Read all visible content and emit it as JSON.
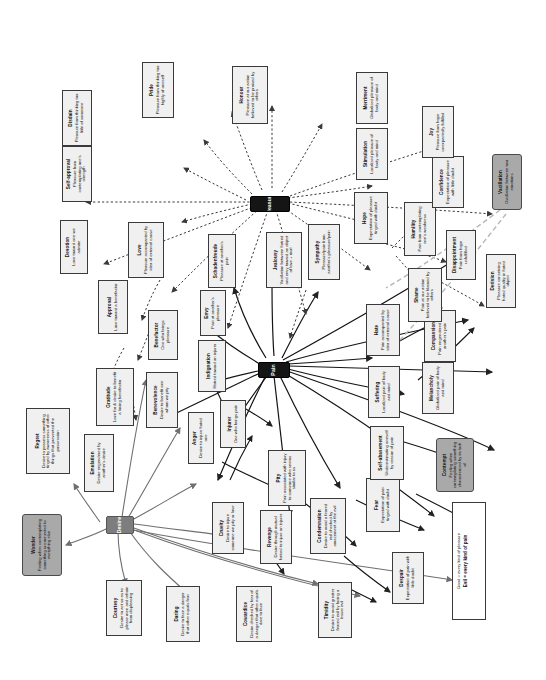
{
  "diagram": {
    "legend": {
      "line1": "Good = every kind of pleasure",
      "line2": "Evil = every kind of pain"
    },
    "core_nodes": [
      {
        "id": "desire",
        "label": "Desire"
      },
      {
        "id": "pain",
        "label": "Pain"
      },
      {
        "id": "pleasure",
        "label": "Pleasure"
      }
    ],
    "nodes": [
      {
        "id": "wonder",
        "title": "Wonder",
        "desc": "Feeling when contemplating something unconnected to everything else",
        "style": "shaded"
      },
      {
        "id": "regret",
        "title": "Regret",
        "desc": "Desire to possess something tinged by awareness of other things that prevented the possession",
        "style": "plain"
      },
      {
        "id": "emulation",
        "title": "Emulation",
        "desc": "Desire engendered by another's desire",
        "style": "plain"
      },
      {
        "id": "courtesy",
        "title": "Courtesy",
        "desc": "Desire to act so as to please men and refrain from displeasing",
        "style": "plain"
      },
      {
        "id": "daring",
        "title": "Daring",
        "desc": "Desire to face a danger that other equals fear",
        "style": "plain"
      },
      {
        "id": "gratitude",
        "title": "Gratitude",
        "desc": "Love for & desire to benefit a loving benefactor",
        "style": "plain"
      },
      {
        "id": "benevolence",
        "title": "Benevolence",
        "desc": "Desire to benefit one whom we pity",
        "style": "plain"
      },
      {
        "id": "benefactor",
        "title": "Benefactor",
        "desc": "One who brings pleasure",
        "style": "plain"
      },
      {
        "id": "approval",
        "title": "Approval",
        "desc": "Love toward a benefactor",
        "style": "plain"
      },
      {
        "id": "love",
        "title": "Love",
        "desc": "Pleasure accompanied by idea of external cause",
        "style": "plain"
      },
      {
        "id": "devotion",
        "title": "Devotion",
        "desc": "Love toward one we admire",
        "style": "plain"
      },
      {
        "id": "self_approval",
        "title": "Self-approval",
        "desc": "Pleasure from contemplating one's strength",
        "style": "plain"
      },
      {
        "id": "disdain",
        "title": "Disdain",
        "desc": "Pleasure from thinking too little of someone",
        "style": "plain"
      },
      {
        "id": "pride",
        "title": "Pride",
        "desc": "Pleasure from thinking too highly of oneself",
        "style": "plain"
      },
      {
        "id": "honour",
        "title": "Honour",
        "desc": "Pleasure at our action believed to be praised by others",
        "style": "plain"
      },
      {
        "id": "anger",
        "title": "Anger",
        "desc": "Desire to injure hated one",
        "style": "plain"
      },
      {
        "id": "injurer",
        "title": "Injurer",
        "desc": "One who brings pain",
        "style": "plain"
      },
      {
        "id": "indignation",
        "title": "Indignation",
        "desc": "Hatred toward an injurer",
        "style": "plain"
      },
      {
        "id": "envy",
        "title": "Envy",
        "desc": "Pain at another's pleasure",
        "style": "plain"
      },
      {
        "id": "schadenfreude",
        "title": "Schadenfreude",
        "desc": "Pleasure at another's pain",
        "style": "plain"
      },
      {
        "id": "jealousy",
        "title": "Jealousy",
        "desc": "Vacillation between hatred and envy toward an object of love + rival",
        "style": "plain"
      },
      {
        "id": "sympathy",
        "title": "Sympathy",
        "desc": "Pleasure/pain from another's pleasure/pain",
        "style": "plain"
      },
      {
        "id": "cruelty",
        "title": "Cruelty",
        "desc": "Desire to injure someone we pity or love",
        "style": "plain"
      },
      {
        "id": "pity",
        "title": "Pity",
        "desc": "Pain associated with injury to someone who seems similar to us",
        "style": "plain"
      },
      {
        "id": "revenge",
        "title": "Revenge",
        "desc": "Desire through mutual hatred to injure an injurer",
        "style": "plain"
      },
      {
        "id": "condemnation",
        "title": "Condemnation",
        "desc": "Desire to avoid a feared evil checked by amazement at the evil",
        "style": "plain"
      },
      {
        "id": "cowardice",
        "title": "Cowardice",
        "desc": "Desire checked by fear of a danger that other equals dare to face",
        "style": "plain"
      },
      {
        "id": "timidity",
        "title": "Timidity",
        "desc": "Desire to avoid greater feared evil by facing a lesser evil",
        "style": "plain"
      },
      {
        "id": "fear",
        "title": "Fear",
        "desc": "Expectation of pain tinged with doubt",
        "style": "plain"
      },
      {
        "id": "despair",
        "title": "Despair",
        "desc": "Expectation of pain with little doubt",
        "style": "plain"
      },
      {
        "id": "self_abasement",
        "title": "Self-abasement",
        "desc": "Underestimating oneself by reason of pain",
        "style": "plain"
      },
      {
        "id": "suffering",
        "title": "Suffering",
        "desc": "Localized pain of body and mind",
        "style": "plain"
      },
      {
        "id": "melancholy",
        "title": "Melancholy",
        "desc": "Globalized pain of body and mind",
        "style": "plain"
      },
      {
        "id": "compassion",
        "title": "Compassion",
        "desc": "Pain engendered by another's pain",
        "style": "plain"
      },
      {
        "id": "hate",
        "title": "Hate",
        "desc": "Pain accompanied by idea of external cause",
        "style": "plain"
      },
      {
        "id": "shame",
        "title": "Shame",
        "desc": "Pain at our action believed to be blamed by others",
        "style": "plain"
      },
      {
        "id": "humility",
        "title": "Humility",
        "desc": "Pain from contemplating one's weakness",
        "style": "plain"
      },
      {
        "id": "hope",
        "title": "Hope",
        "desc": "Expectation of pleasure tinged with doubt",
        "style": "plain"
      },
      {
        "id": "confidence",
        "title": "Confidence",
        "desc": "Expectation of pleasure with little doubt",
        "style": "plain"
      },
      {
        "id": "disappointment",
        "title": "Disappointment",
        "desc": "Pain from hope unfulfilled",
        "style": "plain"
      },
      {
        "id": "joy",
        "title": "Joy",
        "desc": "Pleasure from hope unexpectedly fulfilled",
        "style": "plain"
      },
      {
        "id": "stimulation",
        "title": "Stimulation",
        "desc": "Localized pleasure of body and mind",
        "style": "plain"
      },
      {
        "id": "merriment",
        "title": "Merriment",
        "desc": "Globalized pleasure of body and mind",
        "style": "plain"
      },
      {
        "id": "contempt",
        "title": "Contempt",
        "desc": "Feeling when contemplating something characterized by its lack of",
        "style": "shaded"
      },
      {
        "id": "derision",
        "title": "Derision",
        "desc": "Pleasure conceiving hated quality in hated object",
        "style": "plain"
      },
      {
        "id": "vacillation",
        "title": "Vacillation",
        "desc": "Oscillation between two emotions",
        "style": "shaded"
      }
    ]
  }
}
